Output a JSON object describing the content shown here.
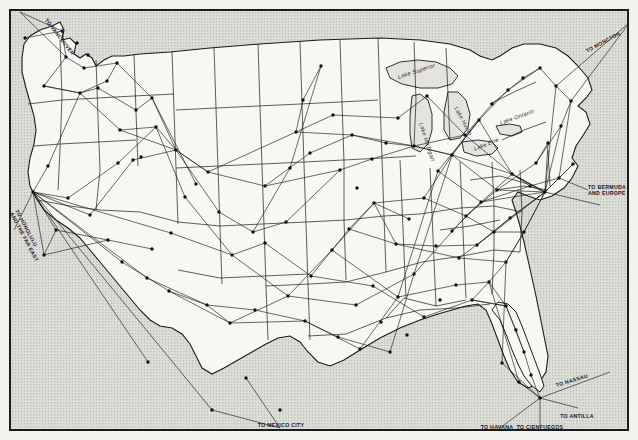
{
  "map": {
    "title": "United States Air Mail and Passenger Route Map",
    "background_color": "#e9e9e4",
    "ocean_color": "#dcdcd6",
    "land_color": "#f6f6f3",
    "line_color": "#1a1a1a",
    "border_color": "#1a1a18",
    "width": 638,
    "height": 440
  },
  "lakes": [
    {
      "name": "Lake Superior",
      "x": 398,
      "y": 74,
      "rotate": -18
    },
    {
      "name": "Lake Michigan",
      "x": 421,
      "y": 120,
      "rotate": 72
    },
    {
      "name": "Lake Huron",
      "x": 456,
      "y": 104,
      "rotate": 62
    },
    {
      "name": "Lake Erie",
      "x": 474,
      "y": 146,
      "rotate": -22
    },
    {
      "name": "Lake Ontario",
      "x": 500,
      "y": 120,
      "rotate": -20
    }
  ],
  "destinations": [
    {
      "label": "TO MEXICO CITY",
      "x": 281,
      "y": 422,
      "rotate": 0,
      "anchor": "bottom-center"
    },
    {
      "label": "TO HAVANA",
      "x": 497,
      "y": 424,
      "rotate": 0,
      "anchor": "bottom-center"
    },
    {
      "label": "TO CIENFUEGOS",
      "x": 540,
      "y": 424,
      "rotate": 0,
      "anchor": "bottom-center"
    },
    {
      "label": "TO ANTILLA",
      "x": 577,
      "y": 413,
      "rotate": 0,
      "anchor": "bottom-center"
    },
    {
      "label": "TO NASSAU",
      "x": 556,
      "y": 382,
      "rotate": -17,
      "anchor": "middle-left"
    },
    {
      "label": "TO BERMUDA\nAND EUROPE",
      "x": 588,
      "y": 184,
      "rotate": 0,
      "anchor": "middle-left"
    },
    {
      "label": "TO MONCTON",
      "x": 586,
      "y": 48,
      "rotate": -28,
      "anchor": "middle-left"
    },
    {
      "label": "TO HONOLULU\nAND THE FAR EAST",
      "x": 14,
      "y": 205,
      "rotate": 62,
      "anchor": "middle-left"
    },
    {
      "label": "TO VANCOUVER",
      "x": 46,
      "y": 16,
      "rotate": 52,
      "anchor": "middle-left"
    }
  ],
  "cities": [
    {
      "x": 33,
      "y": 192
    },
    {
      "x": 25,
      "y": 38
    },
    {
      "x": 62,
      "y": 31
    },
    {
      "x": 66,
      "y": 57
    },
    {
      "x": 44,
      "y": 86
    },
    {
      "x": 84,
      "y": 68
    },
    {
      "x": 117,
      "y": 63
    },
    {
      "x": 80,
      "y": 93
    },
    {
      "x": 98,
      "y": 88
    },
    {
      "x": 107,
      "y": 81
    },
    {
      "x": 120,
      "y": 130
    },
    {
      "x": 136,
      "y": 110
    },
    {
      "x": 152,
      "y": 98
    },
    {
      "x": 156,
      "y": 127
    },
    {
      "x": 133,
      "y": 160
    },
    {
      "x": 141,
      "y": 157
    },
    {
      "x": 118,
      "y": 163
    },
    {
      "x": 88,
      "y": 55
    },
    {
      "x": 77,
      "y": 43
    },
    {
      "x": 48,
      "y": 166
    },
    {
      "x": 56,
      "y": 230
    },
    {
      "x": 44,
      "y": 255
    },
    {
      "x": 68,
      "y": 198
    },
    {
      "x": 90,
      "y": 215
    },
    {
      "x": 108,
      "y": 240
    },
    {
      "x": 122,
      "y": 262
    },
    {
      "x": 147,
      "y": 278
    },
    {
      "x": 169,
      "y": 291
    },
    {
      "x": 152,
      "y": 249
    },
    {
      "x": 171,
      "y": 233
    },
    {
      "x": 185,
      "y": 197
    },
    {
      "x": 196,
      "y": 184
    },
    {
      "x": 208,
      "y": 172
    },
    {
      "x": 176,
      "y": 150
    },
    {
      "x": 207,
      "y": 305
    },
    {
      "x": 230,
      "y": 323
    },
    {
      "x": 255,
      "y": 310
    },
    {
      "x": 232,
      "y": 255
    },
    {
      "x": 253,
      "y": 232
    },
    {
      "x": 219,
      "y": 212
    },
    {
      "x": 265,
      "y": 186
    },
    {
      "x": 290,
      "y": 168
    },
    {
      "x": 310,
      "y": 153
    },
    {
      "x": 321,
      "y": 66
    },
    {
      "x": 303,
      "y": 100
    },
    {
      "x": 296,
      "y": 132
    },
    {
      "x": 333,
      "y": 115
    },
    {
      "x": 352,
      "y": 135
    },
    {
      "x": 340,
      "y": 170
    },
    {
      "x": 357,
      "y": 188
    },
    {
      "x": 372,
      "y": 159
    },
    {
      "x": 386,
      "y": 143
    },
    {
      "x": 374,
      "y": 203
    },
    {
      "x": 349,
      "y": 229
    },
    {
      "x": 332,
      "y": 250
    },
    {
      "x": 311,
      "y": 276
    },
    {
      "x": 288,
      "y": 296
    },
    {
      "x": 305,
      "y": 321
    },
    {
      "x": 338,
      "y": 337
    },
    {
      "x": 360,
      "y": 349
    },
    {
      "x": 381,
      "y": 322
    },
    {
      "x": 398,
      "y": 297
    },
    {
      "x": 414,
      "y": 274
    },
    {
      "x": 396,
      "y": 244
    },
    {
      "x": 409,
      "y": 219
    },
    {
      "x": 424,
      "y": 198
    },
    {
      "x": 438,
      "y": 171
    },
    {
      "x": 414,
      "y": 146
    },
    {
      "x": 398,
      "y": 118
    },
    {
      "x": 427,
      "y": 96
    },
    {
      "x": 452,
      "y": 155
    },
    {
      "x": 465,
      "y": 135
    },
    {
      "x": 479,
      "y": 120
    },
    {
      "x": 492,
      "y": 104
    },
    {
      "x": 508,
      "y": 90
    },
    {
      "x": 523,
      "y": 78
    },
    {
      "x": 540,
      "y": 68
    },
    {
      "x": 556,
      "y": 86
    },
    {
      "x": 571,
      "y": 101
    },
    {
      "x": 561,
      "y": 126
    },
    {
      "x": 548,
      "y": 143
    },
    {
      "x": 536,
      "y": 163
    },
    {
      "x": 573,
      "y": 164
    },
    {
      "x": 559,
      "y": 178
    },
    {
      "x": 545,
      "y": 192
    },
    {
      "x": 530,
      "y": 186
    },
    {
      "x": 512,
      "y": 174
    },
    {
      "x": 497,
      "y": 190
    },
    {
      "x": 481,
      "y": 202
    },
    {
      "x": 466,
      "y": 216
    },
    {
      "x": 452,
      "y": 231
    },
    {
      "x": 436,
      "y": 246
    },
    {
      "x": 459,
      "y": 258
    },
    {
      "x": 477,
      "y": 245
    },
    {
      "x": 494,
      "y": 232
    },
    {
      "x": 510,
      "y": 218
    },
    {
      "x": 524,
      "y": 232
    },
    {
      "x": 506,
      "y": 262
    },
    {
      "x": 489,
      "y": 282
    },
    {
      "x": 472,
      "y": 300
    },
    {
      "x": 456,
      "y": 285
    },
    {
      "x": 440,
      "y": 300
    },
    {
      "x": 424,
      "y": 317
    },
    {
      "x": 407,
      "y": 335
    },
    {
      "x": 390,
      "y": 352
    },
    {
      "x": 506,
      "y": 306
    },
    {
      "x": 516,
      "y": 330
    },
    {
      "x": 524,
      "y": 352
    },
    {
      "x": 531,
      "y": 375
    },
    {
      "x": 540,
      "y": 398
    },
    {
      "x": 519,
      "y": 382
    },
    {
      "x": 502,
      "y": 363
    },
    {
      "x": 246,
      "y": 378
    },
    {
      "x": 212,
      "y": 410
    },
    {
      "x": 148,
      "y": 362
    },
    {
      "x": 280,
      "y": 410
    },
    {
      "x": 373,
      "y": 286
    },
    {
      "x": 356,
      "y": 305
    },
    {
      "x": 286,
      "y": 222
    },
    {
      "x": 265,
      "y": 243
    }
  ],
  "legend": {
    "note": "Airline routes shown as thin lines; cities shown as filled dots"
  }
}
